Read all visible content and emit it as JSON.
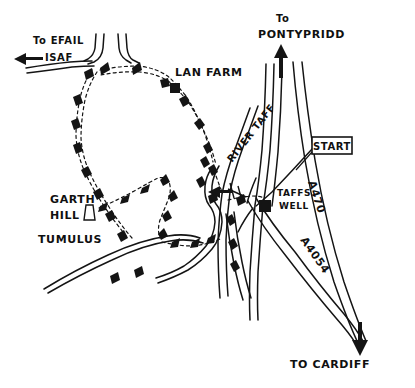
{
  "document": {
    "kind": "hand-drawn-walking-route-map",
    "background_color": "#ffffff",
    "ink_color": "#141414",
    "width": 415,
    "height": 388
  },
  "labels": {
    "to_efail_isaf": "TO EFAIL\nISAF",
    "to_efail_isaf_line1": "To EFAIL",
    "to_efail_isaf_line2": "ISAF",
    "lan_farm": "LAN FARM",
    "to_pontypridd_line1": "To",
    "to_pontypridd_line2": "PONTYPRIDD",
    "river_taff": "RIVER TAFF",
    "start": "START",
    "a470": "A470",
    "taffs_well_line1": "TAFFS",
    "taffs_well_line2": "WELL",
    "a4054": "A4054",
    "garth_hill_line1": "GARTH",
    "garth_hill_line2": "HILL",
    "tumulus": "TUMULUS",
    "to_cardiff": "TO CARDIFF"
  },
  "markers": [
    {
      "name": "lan-farm-marker",
      "type": "filled-square",
      "x": 175,
      "y": 88
    },
    {
      "name": "taffs-well-marker",
      "type": "filled-square",
      "x": 265,
      "y": 206
    },
    {
      "name": "tumulus-marker",
      "type": "trapezoid",
      "x": 89,
      "y": 212
    },
    {
      "name": "bridge-marker",
      "type": "hatched-crossing",
      "x": 236,
      "y": 196
    }
  ],
  "direction_arrows": [
    {
      "name": "arrow-to-efail-isaf",
      "direction": "west",
      "x": 20,
      "y": 59
    },
    {
      "name": "arrow-to-pontypridd",
      "direction": "north",
      "x": 281,
      "y": 62
    },
    {
      "name": "arrow-to-cardiff",
      "direction": "south",
      "x": 360,
      "y": 347
    },
    {
      "name": "arrow-to-taffs-well",
      "direction": "west",
      "x": 216,
      "y": 192
    }
  ],
  "features": {
    "roads": [
      "A470",
      "A4054",
      "unclassified-road-to-efail-isaf",
      "lane-to-garth-hill"
    ],
    "rivers": [
      "RIVER TAFF"
    ],
    "trail": "dashed-walking-route-with-arrowheads"
  }
}
